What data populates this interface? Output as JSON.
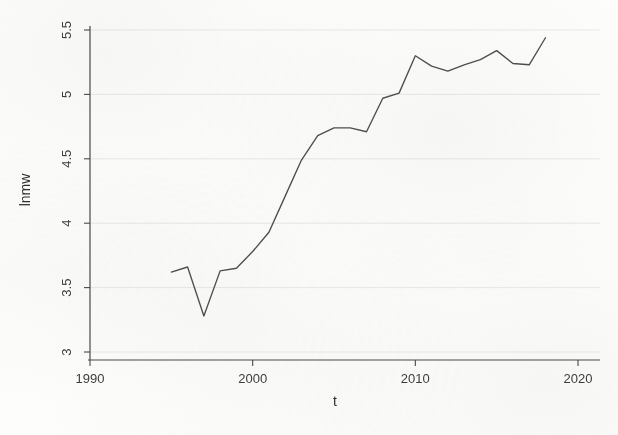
{
  "chart_data": {
    "type": "line",
    "title": "",
    "subtitle": "",
    "xlabel": "t",
    "ylabel": "lnmw",
    "xlim": [
      1990,
      2020
    ],
    "ylim": [
      3,
      5.5
    ],
    "grid": true,
    "grid_axis": "y",
    "legend": "none",
    "line_color": "#4f4f52",
    "xticks": [
      1990,
      2000,
      2010,
      2020
    ],
    "xtick_labels": [
      "1990",
      "2000",
      "2010",
      "2020"
    ],
    "yticks": [
      3,
      3.5,
      4,
      4.5,
      5,
      5.5
    ],
    "ytick_labels": [
      "3",
      "3.5",
      "4",
      "4.5",
      "5",
      "5.5"
    ],
    "x": [
      1995,
      1996,
      1997,
      1998,
      1999,
      2000,
      2001,
      2002,
      2003,
      2004,
      2005,
      2006,
      2007,
      2008,
      2009,
      2010,
      2011,
      2012,
      2013,
      2014,
      2015,
      2016,
      2017,
      2018
    ],
    "series": [
      {
        "name": "lnmw",
        "values": [
          3.62,
          3.66,
          3.28,
          3.63,
          3.65,
          3.78,
          3.93,
          4.21,
          4.49,
          4.68,
          4.74,
          4.74,
          4.71,
          4.97,
          5.01,
          5.3,
          5.22,
          5.18,
          5.23,
          5.27,
          5.34,
          5.24,
          5.23,
          5.44
        ]
      }
    ],
    "axis_color": "#4a4a4a",
    "grid_color": "#e3e3e0",
    "background_color": "#fdfdfc"
  }
}
